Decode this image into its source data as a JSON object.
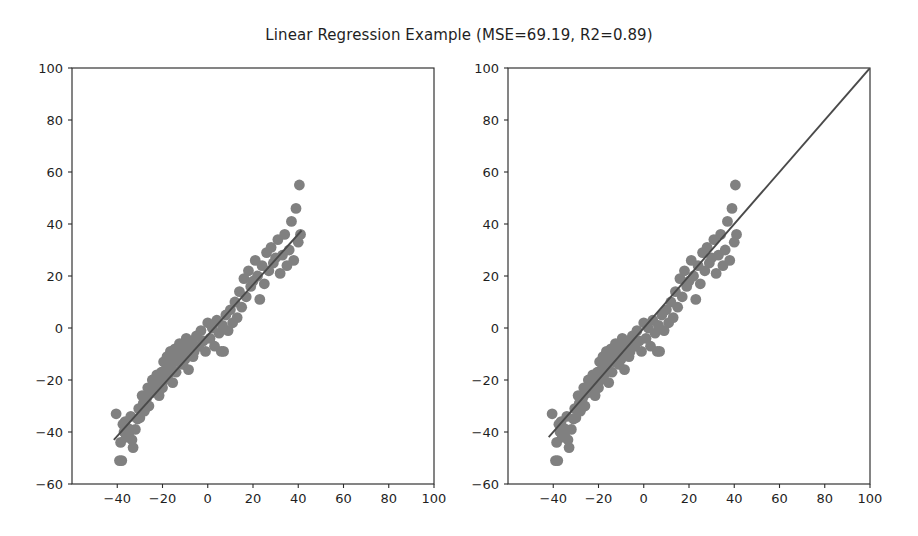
{
  "figure": {
    "title": "Linear Regression Example (MSE=69.19, R2=0.89)",
    "width": 918,
    "height": 536,
    "background": "#ffffff"
  },
  "style": {
    "marker_color": "#808080",
    "line_color": "#4a4a4a",
    "spine_color": "#2b2b2b",
    "text_color": "#1f1f1f",
    "marker_radius": 5.4
  },
  "chart_data": {
    "type": "scatter",
    "title": "Linear Regression Example (MSE=69.19, R2=0.89)",
    "metrics": {
      "MSE": 69.19,
      "R2": 0.89
    },
    "grid": false,
    "legend": null,
    "panels": [
      {
        "name": "left-panel",
        "xlabel": "",
        "ylabel": "",
        "xlim": [
          -60,
          100
        ],
        "ylim": [
          -60,
          100
        ],
        "xticks": [
          -40,
          -20,
          0,
          20,
          40,
          60,
          80,
          100
        ],
        "yticks": [
          -60,
          -40,
          -20,
          0,
          20,
          40,
          60,
          80,
          100
        ],
        "xticklabels": [
          "−40",
          "−20",
          "0",
          "20",
          "40",
          "60",
          "80",
          "100"
        ],
        "yticklabels": [
          "−60",
          "−40",
          "−20",
          "0",
          "20",
          "40",
          "60",
          "80",
          "100"
        ],
        "plot_box_px": [
          72,
          68,
          434,
          484
        ],
        "overlay": {
          "type": "line",
          "name": "regression-fit-line",
          "points": [
            [
              -41.5,
              -43.0
            ],
            [
              41.5,
              37.5
            ]
          ]
        }
      },
      {
        "name": "right-panel",
        "xlabel": "",
        "ylabel": "",
        "xlim": [
          -60,
          100
        ],
        "ylim": [
          -60,
          100
        ],
        "xticks": [
          -40,
          -20,
          0,
          20,
          40,
          60,
          80,
          100
        ],
        "yticks": [
          -60,
          -40,
          -20,
          0,
          20,
          40,
          60,
          80,
          100
        ],
        "xticklabels": [
          "−40",
          "−20",
          "0",
          "20",
          "40",
          "60",
          "80",
          "100"
        ],
        "yticklabels": [
          "−60",
          "−40",
          "−20",
          "0",
          "20",
          "40",
          "60",
          "80",
          "100"
        ],
        "plot_box_px": [
          508,
          68,
          870,
          484
        ],
        "overlay": {
          "type": "line",
          "name": "identity-reference-line",
          "points": [
            [
              -42.0,
              -42.0
            ],
            [
              100.0,
              100.0
            ]
          ]
        }
      }
    ],
    "x": [
      -40.5,
      -39.0,
      -38.5,
      -38.0,
      -37.5,
      -37.0,
      -36.5,
      -36.0,
      -35.5,
      -35.0,
      -34.5,
      -34.0,
      -33.5,
      -33.0,
      -32.0,
      -31.0,
      -30.5,
      -30.0,
      -29.0,
      -28.5,
      -28.0,
      -27.0,
      -26.5,
      -26.0,
      -25.0,
      -24.5,
      -24.0,
      -23.0,
      -22.5,
      -22.0,
      -21.5,
      -21.0,
      -20.5,
      -20.0,
      -19.5,
      -19.0,
      -18.5,
      -18.0,
      -17.5,
      -17.0,
      -16.5,
      -16.0,
      -15.5,
      -15.0,
      -14.5,
      -14.0,
      -13.5,
      -13.0,
      -12.5,
      -12.0,
      -11.5,
      -11.0,
      -10.5,
      -10.0,
      -9.5,
      -9.0,
      -8.5,
      -8.0,
      -7.0,
      -6.5,
      -6.0,
      -5.0,
      -4.0,
      -3.0,
      -2.0,
      -1.0,
      0.0,
      1.0,
      2.0,
      3.0,
      4.0,
      5.0,
      6.0,
      6.5,
      7.0,
      8.0,
      9.0,
      10.0,
      11.0,
      12.0,
      13.0,
      14.0,
      15.0,
      16.0,
      17.0,
      18.0,
      19.0,
      20.0,
      21.0,
      22.0,
      23.0,
      24.0,
      25.0,
      26.0,
      27.0,
      28.0,
      29.0,
      30.0,
      31.0,
      32.0,
      33.0,
      34.0,
      35.0,
      36.0,
      37.0,
      38.0,
      39.0,
      40.0,
      40.5,
      41.0
    ],
    "y": [
      -33.0,
      -51.0,
      -44.0,
      -51.0,
      -37.0,
      -40.0,
      -36.0,
      -42.0,
      -38.5,
      -41.0,
      -39.0,
      -34.0,
      -43.0,
      -46.0,
      -39.0,
      -35.0,
      -31.0,
      -34.5,
      -26.0,
      -29.0,
      -32.0,
      -27.0,
      -23.0,
      -30.0,
      -25.0,
      -20.0,
      -22.5,
      -24.0,
      -18.0,
      -21.0,
      -26.0,
      -19.0,
      -17.0,
      -23.0,
      -13.0,
      -20.0,
      -16.0,
      -11.0,
      -18.0,
      -14.0,
      -9.0,
      -15.5,
      -21.0,
      -12.0,
      -8.0,
      -17.0,
      -10.0,
      -13.0,
      -6.0,
      -11.0,
      -9.5,
      -14.0,
      -7.0,
      -12.0,
      -4.0,
      -10.0,
      -16.0,
      -8.0,
      -5.0,
      -11.0,
      -9.0,
      -3.0,
      -7.0,
      -1.0,
      -5.0,
      -9.0,
      2.0,
      -4.0,
      0.0,
      -7.0,
      3.0,
      -2.0,
      -9.0,
      1.0,
      -9.0,
      5.0,
      -1.0,
      7.0,
      2.0,
      10.0,
      4.0,
      14.0,
      8.0,
      19.0,
      12.0,
      22.0,
      16.0,
      18.0,
      26.0,
      20.0,
      11.0,
      24.0,
      17.0,
      29.0,
      22.0,
      31.0,
      25.0,
      27.0,
      34.0,
      21.0,
      28.0,
      36.0,
      24.0,
      30.0,
      41.0,
      26.0,
      46.0,
      33.0,
      55.0,
      36.0
    ]
  }
}
